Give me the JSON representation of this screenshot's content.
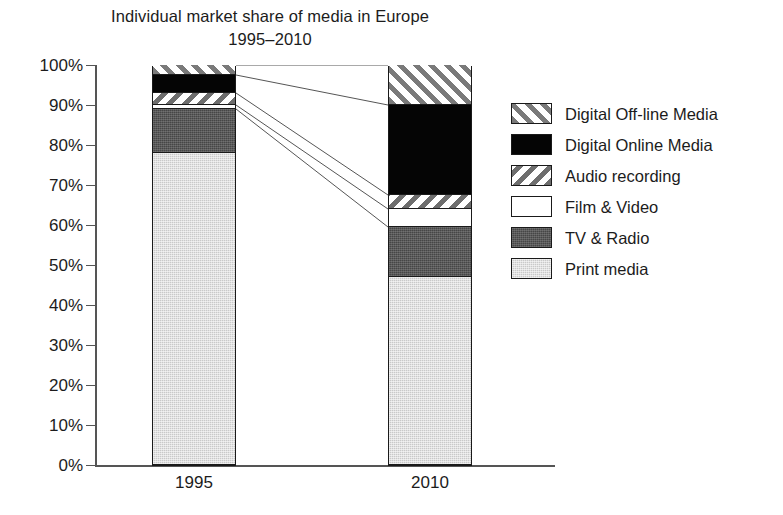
{
  "chart_data": {
    "type": "bar",
    "subtype": "stacked-bar-100-percent",
    "title": "Individual market share of media in Europe",
    "subtitle": "1995–2010",
    "xlabel": "",
    "ylabel": "",
    "categories": [
      "1995",
      "2010"
    ],
    "ylim": [
      0,
      100
    ],
    "ytick_labels": [
      "0%",
      "10%",
      "20%",
      "30%",
      "40%",
      "50%",
      "60%",
      "70%",
      "80%",
      "90%",
      "100%"
    ],
    "ytick_values": [
      0,
      10,
      20,
      30,
      40,
      50,
      60,
      70,
      80,
      90,
      100
    ],
    "grid": false,
    "legend_position": "right",
    "units": "percent",
    "series": [
      {
        "name": "Print media",
        "fill": "solid-light-gray",
        "color": "#c9c9c9",
        "values": [
          78.0,
          47.0
        ]
      },
      {
        "name": "TV & Radio",
        "fill": "solid-dark-gray",
        "color": "#464646",
        "values": [
          11.0,
          12.5
        ]
      },
      {
        "name": "Film & Video",
        "fill": "solid-white",
        "color": "#ffffff",
        "values": [
          1.0,
          4.5
        ]
      },
      {
        "name": "Audio recording",
        "fill": "hatch-backslash",
        "color": "#6e6e6e",
        "values": [
          3.0,
          3.5
        ]
      },
      {
        "name": "Digital Online Media",
        "fill": "solid-black",
        "color": "#050505",
        "values": [
          4.5,
          22.5
        ]
      },
      {
        "name": "Digital Off-line Media",
        "fill": "hatch-forwardslash",
        "color": "#7a7a7a",
        "values": [
          2.5,
          10.0
        ]
      }
    ],
    "cumulative_tops": {
      "1995": [
        78.0,
        89.0,
        90.0,
        93.0,
        97.5,
        100.0
      ],
      "2010": [
        47.0,
        59.5,
        64.0,
        67.5,
        90.0,
        100.0
      ]
    },
    "annotations": [
      "Leader lines connect matching segment boundaries between the 1995 and 2010 bars"
    ]
  },
  "legend": {
    "items": [
      {
        "label": "Digital Off-line Media",
        "swatch": "hatch-forwardslash"
      },
      {
        "label": "Digital Online Media",
        "swatch": "solid-black"
      },
      {
        "label": "Audio recording",
        "swatch": "hatch-backslash"
      },
      {
        "label": "Film & Video",
        "swatch": "solid-white"
      },
      {
        "label": "TV & Radio",
        "swatch": "solid-dark-gray"
      },
      {
        "label": "Print media",
        "swatch": "solid-light-gray"
      }
    ]
  }
}
